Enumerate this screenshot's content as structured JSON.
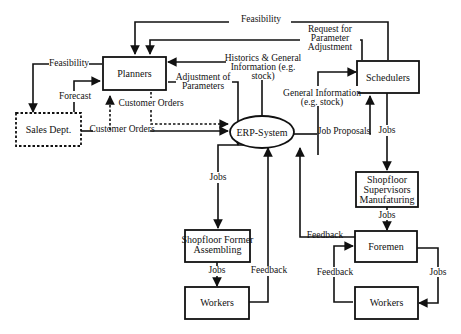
{
  "nodes": {
    "planners": "Planners",
    "sales": "Sales Dept.",
    "erp": "ERP-System",
    "schedulers": "Schedulers",
    "supervisors": [
      "Shopfloor",
      "Supervisors",
      "Manufaturing"
    ],
    "former": [
      "Shopfloor Former",
      "Assembling"
    ],
    "workers_left": "Workers",
    "foremen": "Foremen",
    "workers_right": "Workers"
  },
  "labels": {
    "feasibility_top": "Feasibility",
    "request": [
      "Request for",
      "Parameter",
      "Adjustment"
    ],
    "historics": [
      "Historics & General",
      "Information (e.g.",
      "stock)"
    ],
    "feasibility_left": "Feasibility",
    "forecast": "Forecast",
    "adjustment": [
      "Adjustment of",
      "Parameters"
    ],
    "customer_orders_1": "Customer Orders",
    "customer_orders_2": "Customer Orders",
    "general_info": [
      "General Information",
      "(e.g. stock)"
    ],
    "job_proposals": "Job Proposals",
    "jobs_sched": "Jobs",
    "jobs_erp": "Jobs",
    "jobs_super": "Jobs",
    "feedback_foremen": "Feedback",
    "jobs_former": "Jobs",
    "feedback_workers": "Feedback",
    "feedback_loop": "Feedback",
    "jobs_loop": "Jobs"
  }
}
